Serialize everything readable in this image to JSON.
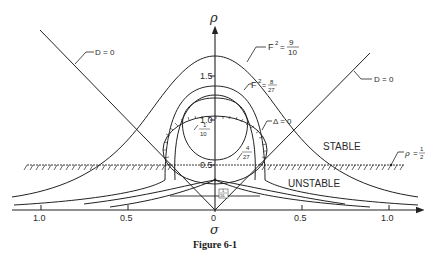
{
  "figure": {
    "caption": "Figure 6-1",
    "axes": {
      "x_label": "σ",
      "y_label": "ρ",
      "x_ticks": [
        {
          "pos": -1.0,
          "label": "1.0"
        },
        {
          "pos": -0.5,
          "label": "0.5"
        },
        {
          "pos": 0,
          "label": "0"
        },
        {
          "pos": 0.5,
          "label": "0.5"
        },
        {
          "pos": 1.0,
          "label": "1.0"
        }
      ],
      "y_ticks": [
        {
          "pos": 0.5,
          "label": "0.5"
        },
        {
          "pos": 1.0,
          "label": "1.0"
        },
        {
          "pos": 1.5,
          "label": "1.5"
        }
      ]
    },
    "labels": {
      "d_zero_left": "D = 0",
      "d_zero_right": "D = 0",
      "f2_outer_prefix": "F",
      "f2_outer_sup": "2",
      "f2_outer_eq": "=",
      "f2_outer_num": "9",
      "f2_outer_den": "10",
      "f2_inner_prefix": "F",
      "f2_inner_sup": "2",
      "f2_inner_eq": "=",
      "f2_inner_num": "8",
      "f2_inner_den": "27",
      "delta_zero": "Δ = 0",
      "frac_1_10_num": "1",
      "frac_1_10_den": "10",
      "frac_4_27_num": "4",
      "frac_4_27_den": "27",
      "frac_1_16_num": "1",
      "frac_1_16_den": "16",
      "stable": "STABLE",
      "unstable": "UNSTABLE",
      "rho_half_lhs": "ρ",
      "rho_half_eq": "=",
      "rho_half_num": "1",
      "rho_half_den": "2"
    },
    "colors": {
      "ink": "#222222",
      "background": "#ffffff"
    }
  }
}
